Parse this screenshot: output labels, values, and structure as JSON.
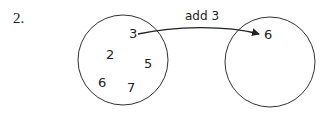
{
  "question_number": "2.",
  "domain_set": {
    "elements": [
      {
        "value": "3",
        "x": 133,
        "y": 39
      },
      {
        "value": "2",
        "x": 109,
        "y": 59
      },
      {
        "value": "5",
        "x": 148,
        "y": 68
      },
      {
        "value": "6",
        "x": 101,
        "y": 87
      },
      {
        "value": "7",
        "x": 130,
        "y": 92
      }
    ]
  },
  "range_set": {
    "elements": [
      {
        "value": "6",
        "x": 265,
        "y": 39
      }
    ]
  },
  "mapping": {
    "label": "add 3",
    "from": "3",
    "to": "6"
  },
  "colors": {
    "stroke": "#333333",
    "text": "#222222"
  }
}
